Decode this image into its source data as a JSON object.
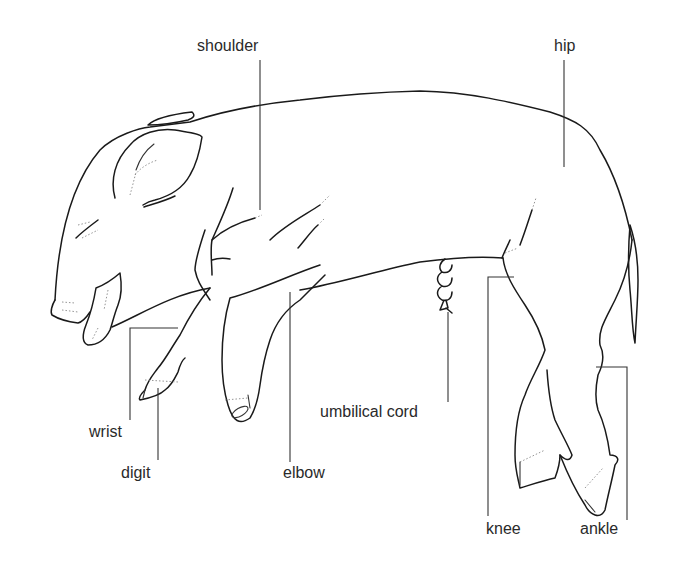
{
  "diagram": {
    "labels": {
      "shoulder": "shoulder",
      "hip": "hip",
      "wrist": "wrist",
      "digit": "digit",
      "elbow": "elbow",
      "umbilical_cord": "umbilical cord",
      "knee": "knee",
      "ankle": "ankle"
    },
    "colors": {
      "line": "#1a1a1a",
      "text": "#2a2a2a",
      "background": "#ffffff"
    }
  }
}
